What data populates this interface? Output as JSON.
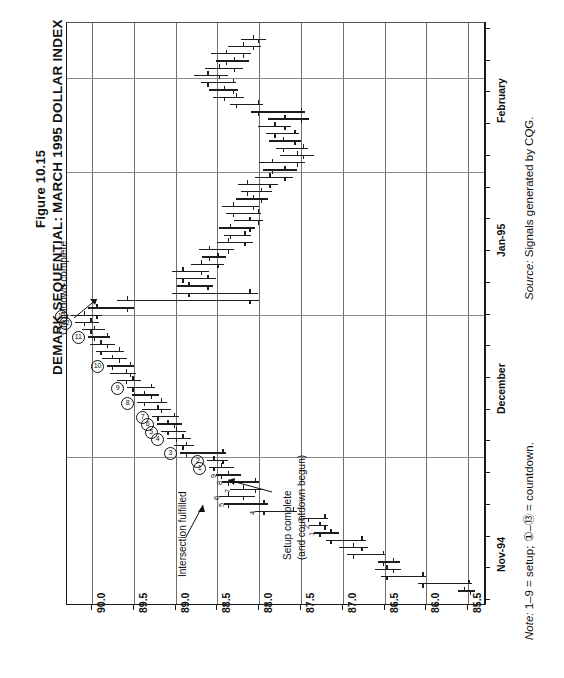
{
  "figure": {
    "number": "Figure 10.15",
    "title": "DEMARK SEQUENTIAL: MARCH 1995 DOLLAR INDEX"
  },
  "footer": {
    "source_italic": "Source:",
    "source_text": " Signals generated by CQG.",
    "note_italic": "Note:",
    "note_text": " 1–9 = setup; ①–⑬ = countdown."
  },
  "annotations": [
    {
      "id": "countdown-complete",
      "text": "Countdown complete"
    },
    {
      "id": "setup-complete",
      "line1": "Setup complete",
      "line2": "(and countdown begun)"
    },
    {
      "id": "intersection-fulfilled",
      "text": "Intersection fulfilled"
    }
  ],
  "chart_data": {
    "type": "ohlc",
    "orientation": "rotated-90-ccw",
    "title": "DEMARK SEQUENTIAL: MARCH 1995 DOLLAR INDEX",
    "xlabel": "",
    "ylabel": "",
    "grid": true,
    "legend": "none",
    "price_axis": {
      "label": "Price",
      "ticks": [
        "90.0",
        "89.5",
        "89.0",
        "88.5",
        "88.0",
        "87.5",
        "87.0",
        "86.5",
        "86.0",
        "85.5"
      ],
      "values": [
        90.0,
        89.5,
        89.0,
        88.5,
        88.0,
        87.5,
        87.0,
        86.5,
        86.0,
        85.5
      ],
      "min": 85.3,
      "max": 90.3
    },
    "date_axis": {
      "label": "Date",
      "ticks": [
        "Nov-94",
        "December",
        "Jan-95",
        "February"
      ],
      "tick_positions_frac": [
        0.105,
        0.375,
        0.645,
        0.875
      ]
    },
    "bars": [
      {
        "i": 0,
        "date": "Nov-94",
        "open": 85.55,
        "high": 85.62,
        "low": 85.42,
        "close": 85.48
      },
      {
        "i": 1,
        "date": "Nov-94",
        "open": 85.5,
        "high": 86.1,
        "low": 85.45,
        "close": 86.05
      },
      {
        "i": 2,
        "date": "Nov-94",
        "open": 86.05,
        "high": 86.55,
        "low": 86.0,
        "close": 86.48
      },
      {
        "i": 3,
        "date": "Nov-94",
        "open": 86.48,
        "high": 86.62,
        "low": 86.3,
        "close": 86.4
      },
      {
        "i": 4,
        "date": "Nov-94",
        "open": 86.4,
        "high": 86.58,
        "low": 86.32,
        "close": 86.52
      },
      {
        "i": 5,
        "date": "Nov-94",
        "open": 86.52,
        "high": 86.95,
        "low": 86.5,
        "close": 86.88
      },
      {
        "i": 6,
        "date": "Nov-94",
        "open": 86.88,
        "high": 87.05,
        "low": 86.7,
        "close": 86.78
      },
      {
        "i": 7,
        "date": "Nov-94",
        "open": 86.78,
        "high": 87.2,
        "low": 86.72,
        "close": 87.15
      },
      {
        "i": 8,
        "date": "Nov-94",
        "open": 87.15,
        "high": 87.35,
        "low": 87.05,
        "close": 87.28,
        "setup": 1
      },
      {
        "i": 9,
        "date": "Nov-94",
        "open": 87.28,
        "high": 87.4,
        "low": 87.18,
        "close": 87.22,
        "setup": 2
      },
      {
        "i": 10,
        "date": "Nov-94",
        "open": 87.22,
        "high": 87.48,
        "low": 87.18,
        "close": 87.42,
        "setup": 3
      },
      {
        "i": 11,
        "date": "Nov-94",
        "open": 87.6,
        "high": 88.05,
        "low": 87.55,
        "close": 87.95,
        "setup": 4
      },
      {
        "i": 12,
        "date": "Nov-94",
        "open": 87.95,
        "high": 88.42,
        "low": 87.9,
        "close": 88.38,
        "setup": 5
      },
      {
        "i": 13,
        "date": "Nov-94",
        "open": 88.38,
        "high": 88.48,
        "low": 88.05,
        "close": 88.2,
        "setup": 6
      },
      {
        "i": 14,
        "date": "Nov-94",
        "open": 88.2,
        "high": 88.35,
        "low": 87.95,
        "close": 88.05,
        "setup": 7
      },
      {
        "i": 15,
        "date": "Nov-94",
        "open": 88.05,
        "high": 88.45,
        "low": 88.0,
        "close": 88.38,
        "setup": 8
      },
      {
        "i": 16,
        "date": "Nov-94",
        "open": 88.38,
        "high": 88.52,
        "low": 88.22,
        "close": 88.46,
        "setup": 9
      },
      {
        "i": 17,
        "date": "Nov-94",
        "open": 88.46,
        "high": 88.6,
        "low": 88.3,
        "close": 88.55,
        "countdown": 1
      },
      {
        "i": 18,
        "date": "Nov-94",
        "open": 88.55,
        "high": 88.62,
        "low": 88.38,
        "close": 88.44,
        "countdown": 2
      },
      {
        "i": 19,
        "date": "Nov-94",
        "open": 88.44,
        "high": 88.95,
        "low": 88.4,
        "close": 88.88,
        "countdown": 3
      },
      {
        "i": 20,
        "date": "Dec-94",
        "open": 88.88,
        "high": 89.02,
        "low": 88.78,
        "close": 88.92
      },
      {
        "i": 21,
        "date": "Dec-94",
        "open": 88.92,
        "high": 89.1,
        "low": 88.82,
        "close": 89.0,
        "countdown": 4
      },
      {
        "i": 22,
        "date": "Dec-94",
        "open": 89.0,
        "high": 89.18,
        "low": 88.88,
        "close": 89.1,
        "countdown": 5
      },
      {
        "i": 23,
        "date": "Dec-94",
        "open": 89.1,
        "high": 89.22,
        "low": 88.92,
        "close": 89.02,
        "countdown": 6
      },
      {
        "i": 24,
        "date": "Dec-94",
        "open": 89.02,
        "high": 89.28,
        "low": 88.96,
        "close": 89.22,
        "countdown": 7
      },
      {
        "i": 25,
        "date": "Dec-94",
        "open": 89.22,
        "high": 89.4,
        "low": 89.05,
        "close": 89.18
      },
      {
        "i": 26,
        "date": "Dec-94",
        "open": 89.18,
        "high": 89.46,
        "low": 89.1,
        "close": 89.38,
        "countdown": 8
      },
      {
        "i": 27,
        "date": "Dec-94",
        "open": 89.38,
        "high": 89.52,
        "low": 89.2,
        "close": 89.3
      },
      {
        "i": 28,
        "date": "Dec-94",
        "open": 89.3,
        "high": 89.58,
        "low": 89.25,
        "close": 89.52,
        "countdown": 9
      },
      {
        "i": 29,
        "date": "Dec-94",
        "open": 89.52,
        "high": 89.7,
        "low": 89.42,
        "close": 89.6
      },
      {
        "i": 30,
        "date": "Dec-94",
        "open": 89.6,
        "high": 89.78,
        "low": 89.48,
        "close": 89.55
      },
      {
        "i": 31,
        "date": "Dec-94",
        "open": 89.55,
        "high": 89.82,
        "low": 89.5,
        "close": 89.76,
        "countdown": 10
      },
      {
        "i": 32,
        "date": "Dec-94",
        "open": 89.76,
        "high": 89.88,
        "low": 89.58,
        "close": 89.68
      },
      {
        "i": 33,
        "date": "Dec-94",
        "open": 89.68,
        "high": 89.95,
        "low": 89.62,
        "close": 89.9
      },
      {
        "i": 34,
        "date": "Dec-94",
        "open": 89.9,
        "high": 90.02,
        "low": 89.72,
        "close": 89.82
      },
      {
        "i": 35,
        "date": "Dec-94",
        "open": 89.82,
        "high": 90.05,
        "low": 89.78,
        "close": 89.98,
        "countdown": 11
      },
      {
        "i": 36,
        "date": "Dec-94",
        "open": 89.98,
        "high": 90.12,
        "low": 89.85,
        "close": 90.02
      },
      {
        "i": 37,
        "date": "Dec-94",
        "open": 90.02,
        "high": 90.2,
        "low": 89.92,
        "close": 90.1,
        "countdown": 12
      },
      {
        "i": 38,
        "date": "Dec-94",
        "open": 90.1,
        "high": 90.25,
        "low": 89.88,
        "close": 89.95,
        "countdown": 13
      },
      {
        "i": 39,
        "date": "Dec-94",
        "open": 89.95,
        "high": 90.05,
        "low": 89.5,
        "close": 89.58
      },
      {
        "i": 40,
        "date": "Dec-94",
        "open": 89.58,
        "high": 89.7,
        "low": 88.0,
        "close": 88.12
      },
      {
        "i": 41,
        "date": "Dec-94",
        "open": 88.12,
        "high": 89.05,
        "low": 88.02,
        "close": 88.85
      },
      {
        "i": 42,
        "date": "Dec-94",
        "open": 88.85,
        "high": 88.98,
        "low": 88.55,
        "close": 88.62
      },
      {
        "i": 43,
        "date": "Dec-94",
        "open": 88.62,
        "high": 89.0,
        "low": 88.52,
        "close": 88.92
      },
      {
        "i": 44,
        "date": "Dec-94",
        "open": 88.92,
        "high": 89.05,
        "low": 88.6,
        "close": 88.7
      },
      {
        "i": 45,
        "date": "Dec-94",
        "open": 88.7,
        "high": 88.82,
        "low": 88.42,
        "close": 88.5
      },
      {
        "i": 46,
        "date": "Dec-94",
        "open": 88.5,
        "high": 88.68,
        "low": 88.4,
        "close": 88.6
      },
      {
        "i": 47,
        "date": "Jan-95",
        "open": 88.6,
        "high": 88.72,
        "low": 88.3,
        "close": 88.38
      },
      {
        "i": 48,
        "date": "Jan-95",
        "open": 88.38,
        "high": 88.5,
        "low": 88.08,
        "close": 88.18
      },
      {
        "i": 49,
        "date": "Jan-95",
        "open": 88.18,
        "high": 88.42,
        "low": 88.1,
        "close": 88.35
      },
      {
        "i": 50,
        "date": "Jan-95",
        "open": 88.35,
        "high": 88.48,
        "low": 88.05,
        "close": 88.12
      },
      {
        "i": 51,
        "date": "Jan-95",
        "open": 88.12,
        "high": 88.3,
        "low": 87.95,
        "close": 88.02
      },
      {
        "i": 52,
        "date": "Jan-95",
        "open": 88.02,
        "high": 88.4,
        "low": 87.98,
        "close": 88.32
      },
      {
        "i": 53,
        "date": "Jan-95",
        "open": 88.32,
        "high": 88.45,
        "low": 88.0,
        "close": 88.08
      },
      {
        "i": 54,
        "date": "Jan-95",
        "open": 88.08,
        "high": 88.28,
        "low": 87.9,
        "close": 87.98
      },
      {
        "i": 55,
        "date": "Jan-95",
        "open": 87.98,
        "high": 88.22,
        "low": 87.85,
        "close": 88.15
      },
      {
        "i": 56,
        "date": "Jan-95",
        "open": 88.15,
        "high": 88.25,
        "low": 87.78,
        "close": 87.88
      },
      {
        "i": 57,
        "date": "Jan-95",
        "open": 87.88,
        "high": 88.05,
        "low": 87.6,
        "close": 87.7
      },
      {
        "i": 58,
        "date": "Jan-95",
        "open": 87.7,
        "high": 87.95,
        "low": 87.55,
        "close": 87.85
      },
      {
        "i": 59,
        "date": "Jan-95",
        "open": 87.85,
        "high": 88.0,
        "low": 87.45,
        "close": 87.55
      },
      {
        "i": 60,
        "date": "Jan-95",
        "open": 87.55,
        "high": 87.75,
        "low": 87.35,
        "close": 87.48
      },
      {
        "i": 61,
        "date": "Jan-95",
        "open": 87.48,
        "high": 87.8,
        "low": 87.42,
        "close": 87.72
      },
      {
        "i": 62,
        "date": "Jan-95",
        "open": 87.72,
        "high": 87.88,
        "low": 87.5,
        "close": 87.58
      },
      {
        "i": 63,
        "date": "Jan-95",
        "open": 87.58,
        "high": 87.92,
        "low": 87.52,
        "close": 87.82
      },
      {
        "i": 64,
        "date": "Jan-95",
        "open": 87.82,
        "high": 88.02,
        "low": 87.62,
        "close": 87.7
      },
      {
        "i": 65,
        "date": "Jan-95",
        "open": 87.7,
        "high": 87.9,
        "low": 87.4,
        "close": 87.5
      },
      {
        "i": 66,
        "date": "Jan-95",
        "open": 87.5,
        "high": 88.1,
        "low": 87.45,
        "close": 88.02
      },
      {
        "i": 67,
        "date": "Jan-95",
        "open": 88.02,
        "high": 88.35,
        "low": 87.95,
        "close": 88.28
      },
      {
        "i": 68,
        "date": "Jan-95",
        "open": 88.28,
        "high": 88.55,
        "low": 88.18,
        "close": 88.42
      },
      {
        "i": 69,
        "date": "Feb-95",
        "open": 88.42,
        "high": 88.6,
        "low": 88.25,
        "close": 88.32
      },
      {
        "i": 70,
        "date": "Feb-95",
        "open": 88.32,
        "high": 88.7,
        "low": 88.28,
        "close": 88.62
      },
      {
        "i": 71,
        "date": "Feb-95",
        "open": 88.62,
        "high": 88.78,
        "low": 88.38,
        "close": 88.48
      },
      {
        "i": 72,
        "date": "Feb-95",
        "open": 88.48,
        "high": 88.65,
        "low": 88.2,
        "close": 88.3
      },
      {
        "i": 73,
        "date": "Feb-95",
        "open": 88.3,
        "high": 88.52,
        "low": 88.12,
        "close": 88.4
      },
      {
        "i": 74,
        "date": "Feb-95",
        "open": 88.4,
        "high": 88.58,
        "low": 88.1,
        "close": 88.2
      },
      {
        "i": 75,
        "date": "Feb-95",
        "open": 88.2,
        "high": 88.38,
        "low": 87.98,
        "close": 88.08
      },
      {
        "i": 76,
        "date": "Feb-95",
        "open": 88.08,
        "high": 88.22,
        "low": 87.92,
        "close": 88.02
      }
    ]
  }
}
